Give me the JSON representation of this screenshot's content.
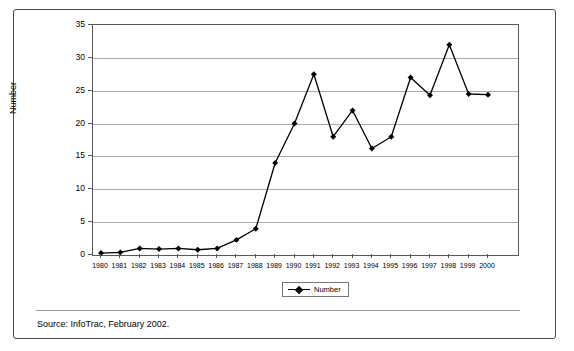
{
  "chart_data": {
    "type": "line",
    "title": "",
    "xlabel": "",
    "ylabel": "Number",
    "ylim": [
      0,
      35
    ],
    "ytick_step": 5,
    "yticks": [
      0,
      5,
      10,
      15,
      20,
      25,
      30,
      35
    ],
    "grid": true,
    "legend_position": "bottom-center",
    "categories": [
      "1980",
      "1981",
      "1982",
      "1983",
      "1984",
      "1985",
      "1986",
      "1987",
      "1988",
      "1989",
      "1990",
      "1991",
      "1992",
      "1993",
      "1994",
      "1995",
      "1996",
      "1997",
      "1998",
      "1999",
      "2000"
    ],
    "series": [
      {
        "name": "Number",
        "marker": "diamond",
        "color": "#000000",
        "values": [
          0.3,
          0.4,
          1.0,
          0.9,
          1.0,
          0.8,
          1.0,
          2.3,
          4.0,
          14.0,
          20.0,
          27.5,
          18.0,
          22.0,
          16.2,
          18.0,
          27.0,
          24.3,
          32.0,
          24.5,
          24.4
        ]
      }
    ]
  },
  "legend": {
    "entries": [
      {
        "label": "Number",
        "marker_icon": "diamond-marker-icon"
      }
    ]
  },
  "footer": {
    "source_text": "Source: InfoTrac, February 2002."
  },
  "colors": {
    "line": "#000000",
    "gridline": "#a9a9a9",
    "axis": "#585858",
    "frame": "#4a4a4a",
    "background": "#ffffff"
  }
}
